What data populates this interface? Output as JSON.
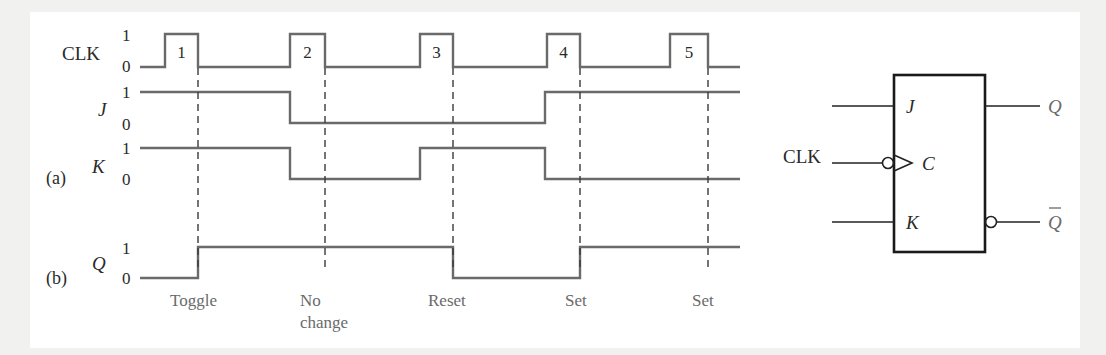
{
  "figure": {
    "part_a_label": "(a)",
    "part_b_label": "(b)",
    "level_high": "1",
    "level_low": "0"
  },
  "signals": {
    "clk": {
      "label": "CLK",
      "pulse_numbers": [
        "1",
        "2",
        "3",
        "4",
        "5"
      ],
      "pulses": [
        [
          165,
          198
        ],
        [
          290,
          325
        ],
        [
          420,
          453
        ],
        [
          547,
          580
        ],
        [
          670,
          708
        ]
      ],
      "x_start": 140,
      "x_end": 740,
      "y_high": 34,
      "y_low": 67
    },
    "j": {
      "label": "J",
      "segments": [
        [
          140,
          1
        ],
        [
          290,
          0
        ],
        [
          545,
          1
        ],
        [
          740,
          null
        ]
      ],
      "y_high": 92,
      "y_low": 123
    },
    "k": {
      "label": "K",
      "segments": [
        [
          140,
          1
        ],
        [
          290,
          0
        ],
        [
          420,
          1
        ],
        [
          545,
          0
        ],
        [
          740,
          null
        ]
      ],
      "y_high": 148,
      "y_low": 179
    },
    "q": {
      "label": "Q",
      "segments": [
        [
          140,
          0
        ],
        [
          198,
          1
        ],
        [
          453,
          0
        ],
        [
          580,
          1
        ],
        [
          740,
          null
        ]
      ],
      "y_high": 247,
      "y_low": 278
    }
  },
  "triggers": [
    {
      "x": 198,
      "action": "Toggle",
      "action_line2": ""
    },
    {
      "x": 325,
      "action": "No",
      "action_line2": "change"
    },
    {
      "x": 453,
      "action": "Reset",
      "action_line2": ""
    },
    {
      "x": 580,
      "action": "Set",
      "action_line2": ""
    },
    {
      "x": 708,
      "action": "Set",
      "action_line2": ""
    }
  ],
  "flip_flop": {
    "input_j": "J",
    "input_clk": "CLK",
    "input_c": "C",
    "input_k": "K",
    "output_q": "Q",
    "output_q_bar": "Q",
    "clock_edge": "negative (bubble on clock input)"
  },
  "colors": {
    "waveform": "#6a6a6a",
    "dashes": "#3a3a3a",
    "box": "#1a1a1a",
    "background": "#ffffff",
    "frame": "#f1f1f0"
  }
}
